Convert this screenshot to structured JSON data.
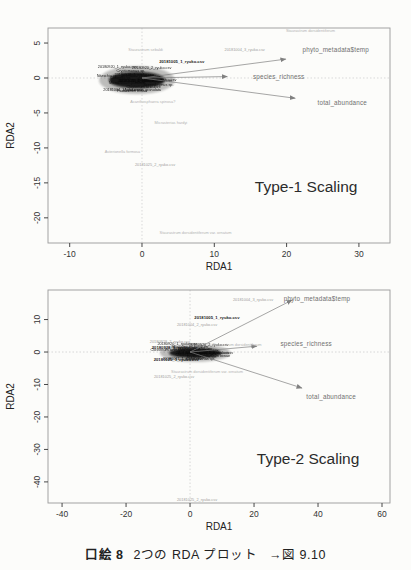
{
  "page": {
    "background": "#fcfcfa",
    "caption": {
      "label": "口絵 8",
      "title": "2つの RDA プロット",
      "ref": "→図 9.10"
    }
  },
  "chart_data": [
    {
      "type": "scatter",
      "subtype": "rda-triplot",
      "title": "Type-1 Scaling",
      "title_pos": {
        "x": 22.7,
        "y": -15.5
      },
      "xlabel": "RDA1",
      "ylabel": "RDA2",
      "xlim": [
        -13.0,
        34.3
      ],
      "ylim": [
        -23.6,
        7.15
      ],
      "xticks": [
        -10,
        0,
        10,
        20,
        30
      ],
      "yticks": [
        5,
        0,
        -5,
        -10,
        -15,
        -20
      ],
      "zero_lines": true,
      "arrows": [
        {
          "label": "phyto_metadata$temp",
          "x": 19.9,
          "y": 2.7,
          "label_x": 26.8,
          "label_y": 4.0
        },
        {
          "label": "species_richness",
          "x": 11.8,
          "y": 0.2,
          "label_x": 18.9,
          "label_y": 0.2
        },
        {
          "label": "total_abundance",
          "x": 21.2,
          "y": -2.9,
          "label_x": 27.7,
          "label_y": -3.6
        }
      ],
      "point_labels": [
        {
          "text": "Staurastrum dorsidentiferum",
          "x": 23.3,
          "y": 6.7,
          "class": "species"
        },
        {
          "text": "20181004_3_ryuko.csv",
          "x": 14.2,
          "y": 4.1,
          "class": "site"
        },
        {
          "text": "Staurastrum sebaldi",
          "x": 0.5,
          "y": 4.0,
          "class": "species"
        },
        {
          "text": "20181005_1_ryuko.csv",
          "x": 5.5,
          "y": 2.4,
          "class": "site-bold"
        },
        {
          "text": "Acanthosphaera spinosa?",
          "x": 1.5,
          "y": -3.4,
          "class": "species"
        },
        {
          "text": "Micrasterias hardyi",
          "x": 4.0,
          "y": -6.4,
          "class": "species"
        },
        {
          "text": "Asterionella formosa",
          "x": -2.7,
          "y": -10.6,
          "class": "species"
        },
        {
          "text": "20181025_2_ryuko.csv",
          "x": 1.8,
          "y": -12.4,
          "class": "site"
        },
        {
          "text": "Staurastrum dorsidentiferum var. ornatum",
          "x": 7.4,
          "y": -22.1,
          "class": "species"
        }
      ],
      "cluster": {
        "cx": -0.7,
        "cy": -0.3,
        "rx": 5.0,
        "ry": 1.9,
        "overlapping_labels_illegible": [
          "20180920_1_ryuko.csv",
          "20180920_2_ryuko.csv",
          "20180927_1_ryuko.csv",
          "20180928_1_ryuko.csv",
          "20181004_1_ryuko.csv",
          "20181011_1_ryuko.csv",
          "20181011_2_ryuko.csv",
          "20181018_1_ryuko.csv",
          "20181018_2_ryuko.csv",
          "20181025_1_ryuko.csv",
          "Nitzschia sp.",
          "Aulacoseira granulata",
          "Closterium aciculare",
          "Cryptomonas sp.",
          "Scenedesmus sp.",
          "Micractinium pusillum",
          "Pediastrum biwae",
          "Chlorella sp."
        ]
      }
    },
    {
      "type": "scatter",
      "subtype": "rda-triplot",
      "title": "Type-2 Scaling",
      "title_pos": {
        "x": 36.9,
        "y": -32.6
      },
      "xlabel": "RDA1",
      "ylabel": "RDA2",
      "xlim": [
        -44.4,
        62.5
      ],
      "ylim": [
        -46.5,
        19.1
      ],
      "xticks": [
        -40,
        -20,
        0,
        20,
        40,
        60
      ],
      "yticks": [
        10,
        0,
        -10,
        -20,
        -30,
        -40
      ],
      "zero_lines": true,
      "arrows": [
        {
          "label": "phyto_metadata$temp",
          "x": 31.9,
          "y": 16.0,
          "label_x": 39.7,
          "label_y": 16.3
        },
        {
          "label": "species_richness",
          "x": 20.9,
          "y": 1.8,
          "label_x": 36.3,
          "label_y": 2.5
        },
        {
          "label": "total_abundance",
          "x": 35.0,
          "y": -11.1,
          "label_x": 44.1,
          "label_y": -13.8
        }
      ],
      "point_labels": [
        {
          "text": "20181004_3_ryuko.csv",
          "x": 19.7,
          "y": 16.0,
          "class": "site"
        },
        {
          "text": "20181005_1_ryuko.csv",
          "x": 8.4,
          "y": 10.5,
          "class": "site-bold"
        },
        {
          "text": "20181004_2_ryuko.csv",
          "x": 2.2,
          "y": 8.3,
          "class": "site"
        },
        {
          "text": "20180928_2_ryuko.csv",
          "x": -6.3,
          "y": 3.1,
          "class": "site"
        },
        {
          "text": "20180928_1_ryuko.csv",
          "x": -4.9,
          "y": 1.4,
          "class": "site-bold"
        },
        {
          "text": "Staurastrum dorsidentiferum",
          "x": 14.7,
          "y": 2.2,
          "class": "species"
        },
        {
          "text": "20181025_1_ryuko.csv",
          "x": -4.3,
          "y": -2.4,
          "class": "site-bold"
        },
        {
          "text": "Staurastrum dorsidentiferum var. ornatum",
          "x": 5.3,
          "y": -6.2,
          "class": "species"
        },
        {
          "text": "20181025_2_ryuko.csv",
          "x": -5.0,
          "y": -7.7,
          "class": "site"
        },
        {
          "text": "20181025_2_ryuko.csv",
          "x": 2.2,
          "y": -45.5,
          "class": "site"
        }
      ],
      "cluster": {
        "cx": 1.6,
        "cy": -0.3,
        "rx": 10.5,
        "ry": 2.6,
        "overlapping_labels_illegible": [
          "20180920_1_ryuko.csv",
          "20180920_2_ryuko.csv",
          "20180927_1_ryuko.csv",
          "20181004_1_ryuko.csv",
          "20181011_1_ryuko.csv",
          "20181011_2_ryuko.csv",
          "20181018_1_ryuko.csv",
          "20181018_2_ryuko.csv",
          "Nitzschia sp.",
          "Aulacoseira granulata",
          "Closterium aciculare",
          "Cryptomonas sp.",
          "Scenedesmus sp.",
          "Micractinium pusillum",
          "Pediastrum biwae",
          "Chlorella sp."
        ]
      }
    }
  ],
  "colors": {
    "box": "#9a9a9a",
    "zero_line": "#c8c8c8",
    "tick_text": "#333333",
    "axis_label": "#222222",
    "arrow": "#808080",
    "arrow_label": "#6f6f6f",
    "species_label": "#b3b3b3",
    "site_label": "#9c9c9c",
    "site_bold_label": "#1a1a1a",
    "cluster": "#111111",
    "title_text": "#2b2b2b"
  }
}
